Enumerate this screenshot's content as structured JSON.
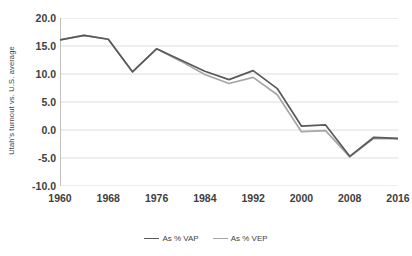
{
  "chart_data": {
    "type": "line",
    "title": "",
    "xlabel": "",
    "ylabel": "Utah's turnout vs. U.S. average",
    "xlim": [
      1960,
      2016
    ],
    "ylim": [
      -10.0,
      20.0
    ],
    "ytick_step": 5.0,
    "xtick_step": 4,
    "grid": true,
    "legend_position": "bottom",
    "x": [
      1960,
      1964,
      1968,
      1972,
      1976,
      1980,
      1984,
      1988,
      1992,
      1996,
      2000,
      2004,
      2008,
      2012,
      2016
    ],
    "y_ticks": [
      "20.0",
      "15.0",
      "10.0",
      "5.0",
      "0.0",
      "-5.0",
      "-10.0"
    ],
    "y_tick_values": [
      20.0,
      15.0,
      10.0,
      5.0,
      0.0,
      -5.0,
      -10.0
    ],
    "x_ticks": [
      "1960",
      "1968",
      "1976",
      "1984",
      "1992",
      "2000",
      "2008",
      "2016"
    ],
    "x_tick_values": [
      1960,
      1968,
      1976,
      1984,
      1992,
      2000,
      2008,
      2016
    ],
    "x_minor_ticks": [
      1964,
      1972,
      1980,
      1988,
      1996,
      2004,
      2012
    ],
    "series": [
      {
        "name": "As % VAP",
        "color": "#595959",
        "values": [
          16.1,
          16.9,
          16.2,
          10.4,
          14.5,
          12.5,
          10.5,
          9.0,
          10.6,
          7.4,
          0.7,
          0.9,
          -4.7,
          -1.3,
          -1.5
        ]
      },
      {
        "name": "As % VEP",
        "color": "#a6a6a6",
        "values": [
          16.1,
          16.9,
          16.2,
          10.4,
          14.5,
          12.3,
          9.9,
          8.3,
          9.4,
          6.3,
          -0.3,
          -0.1,
          -4.8,
          -1.5,
          -1.6
        ]
      }
    ]
  },
  "axis": {
    "y_title": "Utah's turnout vs. U.S. average"
  },
  "legend": {
    "items": [
      {
        "label": "As % VAP",
        "color": "#595959"
      },
      {
        "label": "As % VEP",
        "color": "#a6a6a6"
      }
    ]
  },
  "style": {
    "grid_color": "#d9d9d9",
    "axis_color": "#bfbfbf",
    "text_color": "#404040",
    "background": "#ffffff"
  }
}
